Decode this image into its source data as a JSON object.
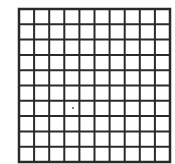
{
  "grid": {
    "rows": 10,
    "cols": 10,
    "left": 19,
    "top": 9,
    "width": 151,
    "height": 153,
    "line_color": "#2a2a2a",
    "line_width": 2,
    "outer_line_width": 2.5,
    "background": "#ffffff"
  },
  "dot": {
    "x": 73,
    "y": 108,
    "radius": 1,
    "color": "#555555"
  }
}
